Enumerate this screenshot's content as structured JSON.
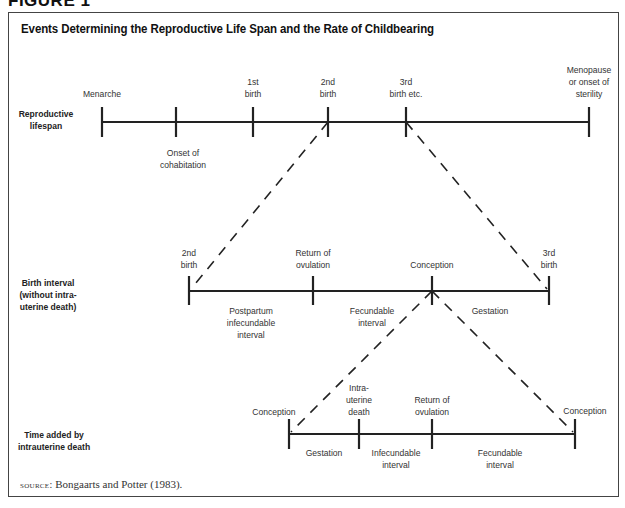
{
  "figure": {
    "label": "FIGURE 1",
    "title": "Events Determining the Reproductive Life Span and the Rate of Childbearing"
  },
  "rows": {
    "reproductive": {
      "label_line1": "Reproductive",
      "label_line2": "lifespan",
      "events": [
        {
          "line1": "Menarche",
          "line2": ""
        },
        {
          "line1": "Onset of",
          "line2": "cohabitation"
        },
        {
          "line1": "1st",
          "line2": "birth"
        },
        {
          "line1": "2nd",
          "line2": "birth"
        },
        {
          "line1": "3rd",
          "line2": "birth etc."
        },
        {
          "line1": "Menopause",
          "line2": "or onset of",
          "line3": "sterility"
        }
      ]
    },
    "birth_interval": {
      "label_line1": "Birth interval",
      "label_line2": "(without intra-",
      "label_line3": "uterine death)",
      "events": [
        {
          "line1": "2nd",
          "line2": "birth"
        },
        {
          "line1": "Return of",
          "line2": "ovulation"
        },
        {
          "line1": "Conception"
        },
        {
          "line1": "3rd",
          "line2": "birth"
        }
      ],
      "segments": [
        {
          "line1": "Postpartum",
          "line2": "infecundable",
          "line3": "interval"
        },
        {
          "line1": "Fecundable",
          "line2": "interval"
        },
        {
          "line1": "Gestation"
        }
      ]
    },
    "intrauterine": {
      "label_line1": "Time added by",
      "label_line2": "intrauterine death",
      "events": [
        {
          "line1": "Conception"
        },
        {
          "line1": "Intra-",
          "line2": "uterine",
          "line3": "death"
        },
        {
          "line1": "Return of",
          "line2": "ovulation"
        },
        {
          "line1": "Conception"
        }
      ],
      "segments": [
        {
          "line1": "Gestation"
        },
        {
          "line1": "Infecundable",
          "line2": "interval"
        },
        {
          "line1": "Fecundable",
          "line2": "interval"
        }
      ]
    }
  },
  "source": {
    "prefix": "source:",
    "text": "Bongaarts and Potter (1983)."
  }
}
